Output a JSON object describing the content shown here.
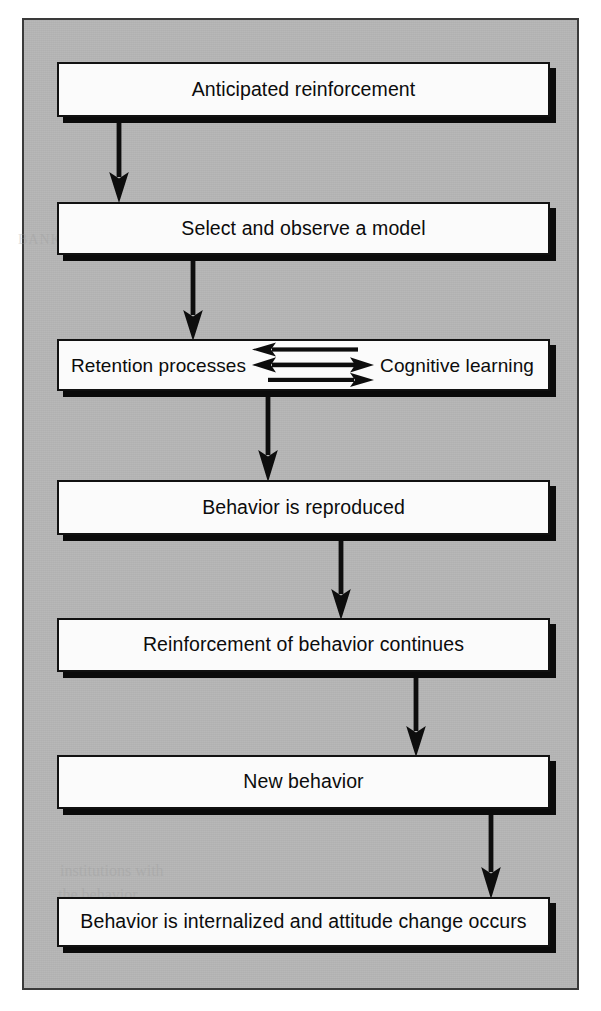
{
  "diagram": {
    "background_color": "#b6b6b6",
    "page_color": "#ffffff",
    "box_fill": "#fbfbfb",
    "ink_color": "#111111",
    "shadow_color": "#0b0b0b",
    "nodes": [
      {
        "id": "anticipated-reinforcement",
        "label": "Anticipated reinforcement",
        "x": 33,
        "y": 42,
        "width": 493,
        "height": 55
      },
      {
        "id": "select-and-observe-a-model",
        "label": "Select and observe a model",
        "x": 33,
        "y": 182,
        "width": 493,
        "height": 53
      },
      {
        "id": "retention-cognitive",
        "label_left": "Retention processes",
        "label_right": "Cognitive learning",
        "x": 33,
        "y": 319,
        "width": 493,
        "height": 52
      },
      {
        "id": "behavior-is-reproduced",
        "label": "Behavior is reproduced",
        "x": 33,
        "y": 460,
        "width": 493,
        "height": 55
      },
      {
        "id": "reinforcement-of-behavior-continues",
        "label": "Reinforcement of behavior continues",
        "x": 33,
        "y": 598,
        "width": 493,
        "height": 54
      },
      {
        "id": "new-behavior",
        "label": "New behavior",
        "x": 33,
        "y": 735,
        "width": 493,
        "height": 54
      },
      {
        "id": "behavior-is-internalized",
        "label": "Behavior is internalized and attitude change occurs",
        "x": 33,
        "y": 877,
        "width": 493,
        "height": 50
      }
    ],
    "connectors": [
      {
        "id": "connector-1",
        "from": "anticipated-reinforcement",
        "to": "select-and-observe-a-model",
        "x": 94,
        "y": 97,
        "height": 85,
        "direction": "down"
      },
      {
        "id": "connector-2",
        "from": "select-and-observe-a-model",
        "to": "retention-cognitive",
        "x": 168,
        "y": 235,
        "height": 84,
        "direction": "down"
      },
      {
        "id": "connector-3",
        "from": "retention-cognitive",
        "to": "behavior-is-reproduced",
        "x": 243,
        "y": 371,
        "height": 89,
        "direction": "down"
      },
      {
        "id": "connector-4",
        "from": "behavior-is-reproduced",
        "to": "reinforcement-of-behavior-continues",
        "x": 316,
        "y": 515,
        "height": 83,
        "direction": "down"
      },
      {
        "id": "connector-5",
        "from": "reinforcement-of-behavior-continues",
        "to": "new-behavior",
        "x": 391,
        "y": 652,
        "height": 83,
        "direction": "down"
      },
      {
        "id": "connector-6",
        "from": "new-behavior",
        "to": "behavior-is-internalized",
        "x": 466,
        "y": 789,
        "height": 88,
        "direction": "down"
      }
    ],
    "inner_arrows": [
      {
        "id": "inner-arrow-top",
        "direction": "left",
        "label": "cognitive learning to retention processes"
      },
      {
        "id": "inner-arrow-middle",
        "direction": "both",
        "label": "retention processes and cognitive learning interact"
      },
      {
        "id": "inner-arrow-bottom",
        "direction": "right",
        "label": "retention processes to cognitive learning"
      }
    ],
    "bleed_text": [
      {
        "text": "to the",
        "x": 300,
        "y": 74,
        "size": 15
      },
      {
        "text": "BANKING",
        "x": 14,
        "y": 238,
        "size": 14
      },
      {
        "text": "institutions with",
        "x": 60,
        "y": 868,
        "size": 16
      },
      {
        "text": "the behavior",
        "x": 58,
        "y": 892,
        "size": 16
      }
    ]
  }
}
